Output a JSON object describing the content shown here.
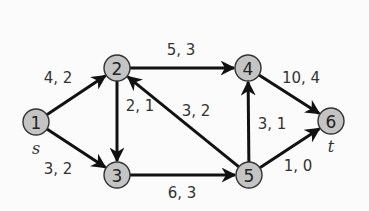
{
  "diagram": {
    "type": "directed-flow-network",
    "nodes": [
      {
        "id": "1",
        "label": "1",
        "x": 36,
        "y": 122,
        "terminal": "s"
      },
      {
        "id": "2",
        "label": "2",
        "x": 117,
        "y": 68
      },
      {
        "id": "3",
        "label": "3",
        "x": 117,
        "y": 175
      },
      {
        "id": "4",
        "label": "4",
        "x": 248,
        "y": 68
      },
      {
        "id": "5",
        "label": "5",
        "x": 249,
        "y": 175
      },
      {
        "id": "6",
        "label": "6",
        "x": 331,
        "y": 121,
        "terminal": "t"
      }
    ],
    "edges": [
      {
        "from": "1",
        "to": "2",
        "label": "4, 2",
        "lx": 58,
        "ly": 78
      },
      {
        "from": "1",
        "to": "3",
        "label": "3, 2",
        "lx": 58,
        "ly": 169
      },
      {
        "from": "2",
        "to": "4",
        "label": "5, 3",
        "lx": 181,
        "ly": 50
      },
      {
        "from": "2",
        "to": "3",
        "label": "2, 1",
        "lx": 140,
        "ly": 106
      },
      {
        "from": "5",
        "to": "2",
        "label": "3, 2",
        "lx": 196,
        "ly": 111
      },
      {
        "from": "3",
        "to": "5",
        "label": "6, 3",
        "lx": 182,
        "ly": 193
      },
      {
        "from": "5",
        "to": "4",
        "label": "3, 1",
        "lx": 272,
        "ly": 124
      },
      {
        "from": "4",
        "to": "6",
        "label": "10, 4",
        "lx": 301,
        "ly": 78
      },
      {
        "from": "5",
        "to": "6",
        "label": "1, 0",
        "lx": 298,
        "ly": 166
      }
    ],
    "terminals": {
      "source": {
        "label": "s",
        "x": 36,
        "y": 148
      },
      "sink": {
        "label": "t",
        "x": 331,
        "y": 146
      }
    },
    "colors": {
      "background": "#fbfbfb",
      "node_fill": "#c4c4c4",
      "node_stroke": "#333333",
      "edge": "#111111",
      "text": "#333333"
    }
  }
}
